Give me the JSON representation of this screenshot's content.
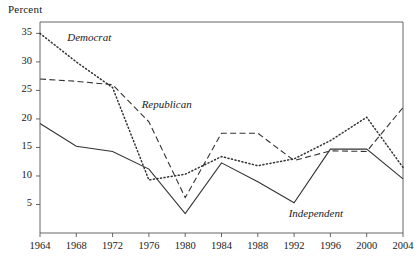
{
  "chart_data": {
    "type": "line",
    "title": "",
    "subtitle": "",
    "ylabel": "Percent",
    "xlabel": "",
    "x": [
      1964,
      1968,
      1972,
      1976,
      1980,
      1984,
      1988,
      1992,
      1996,
      2000,
      2004
    ],
    "xtick_labels": [
      "1964",
      "1968",
      "1972",
      "1976",
      "1980",
      "1984",
      "1988",
      "1992",
      "1996",
      "2000",
      "2004"
    ],
    "ytick_labels": [
      "5",
      "10",
      "15",
      "20",
      "25",
      "30",
      "35"
    ],
    "yticks": [
      5,
      10,
      15,
      20,
      25,
      30,
      35
    ],
    "ylim": [
      0,
      37
    ],
    "xlim": [
      1964,
      2004
    ],
    "grid": false,
    "legend_position": "inline-annotations",
    "series": [
      {
        "name": "Democrat",
        "style": "dotted",
        "color": "#333333",
        "label_text": "Democrat",
        "values": [
          35.0,
          30.0,
          25.5,
          9.3,
          10.3,
          13.4,
          11.8,
          13.0,
          16.2,
          20.3,
          11.5
        ]
      },
      {
        "name": "Republican",
        "style": "dashed",
        "color": "#333333",
        "label_text": "Republican",
        "values": [
          27.0,
          26.6,
          26.0,
          19.5,
          6.2,
          17.5,
          17.5,
          12.7,
          14.4,
          14.3,
          22.0
        ]
      },
      {
        "name": "Independent",
        "style": "solid",
        "color": "#333333",
        "label_text": "Independent",
        "values": [
          19.2,
          15.2,
          14.3,
          11.2,
          3.4,
          12.3,
          9.0,
          5.3,
          14.7,
          14.7,
          9.5
        ]
      }
    ],
    "annotations": [
      {
        "text": "Democrat",
        "x": 1967.0,
        "y": 34.0
      },
      {
        "text": "Republican",
        "x": 1975.2,
        "y": 22.3
      },
      {
        "text": "Independent",
        "x": 1991.4,
        "y": 3.2
      }
    ]
  }
}
